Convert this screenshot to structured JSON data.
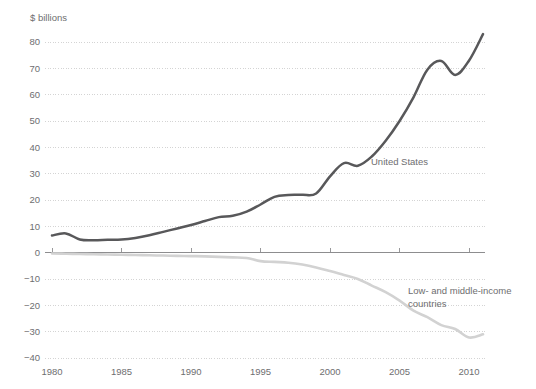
{
  "chart_data": {
    "type": "line",
    "title": "",
    "subtitle": "",
    "unit_label": "$ billions",
    "xlabel": "",
    "ylabel": "$ billions",
    "xlim": [
      1980,
      2011
    ],
    "ylim": [
      -40,
      85
    ],
    "grid": true,
    "legend_position": "inline-annotation",
    "yticks": [
      80,
      70,
      60,
      50,
      40,
      30,
      20,
      10,
      0,
      -10,
      -20,
      -30,
      -40
    ],
    "ytick_labels": [
      "80",
      "70",
      "60",
      "50",
      "40",
      "30",
      "20",
      "10",
      "0",
      "−10",
      "−20",
      "−30",
      "−40"
    ],
    "xticks": [
      1980,
      1985,
      1990,
      1995,
      2000,
      2005,
      2010
    ],
    "xtick_labels": [
      "1980",
      "1985",
      "1990",
      "1995",
      "2000",
      "2005",
      "2010"
    ],
    "x": [
      1980,
      1981,
      1982,
      1983,
      1984,
      1985,
      1986,
      1987,
      1988,
      1989,
      1990,
      1991,
      1992,
      1993,
      1994,
      1995,
      1996,
      1997,
      1998,
      1999,
      2000,
      2001,
      2002,
      2003,
      2004,
      2005,
      2006,
      2007,
      2008,
      2009,
      2010,
      2011
    ],
    "series": [
      {
        "name": "United States",
        "color": "#58585a",
        "label_x": 2004.3,
        "label_y": 38,
        "values": [
          6.5,
          7.3,
          5.0,
          4.7,
          4.9,
          5.0,
          5.6,
          6.6,
          7.9,
          9.2,
          10.5,
          12.0,
          13.5,
          14.0,
          15.6,
          18.3,
          21.2,
          21.9,
          22.0,
          22.5,
          29.0,
          34.0,
          33.0,
          36.5,
          42.5,
          50.0,
          59.0,
          69.5,
          72.8,
          67.5,
          73.0,
          83.0
        ]
      },
      {
        "name": "Low- and middle-income countries",
        "color": "#d2d2d2",
        "label_x": 2006.2,
        "label_y": -14.5,
        "values": [
          -0.3,
          -0.4,
          -0.5,
          -0.6,
          -0.7,
          -0.8,
          -0.9,
          -1.0,
          -1.1,
          -1.2,
          -1.3,
          -1.4,
          -1.6,
          -1.8,
          -2.0,
          -3.2,
          -3.5,
          -3.8,
          -4.5,
          -5.6,
          -7.0,
          -8.5,
          -10.0,
          -12.5,
          -15.0,
          -18.2,
          -22.0,
          -24.5,
          -27.5,
          -29.0,
          -32.2,
          -31.0
        ]
      }
    ],
    "annotations": [
      {
        "text": "United States",
        "series": "United States"
      },
      {
        "text": "Low- and middle-income",
        "series": "Low- and middle-income countries"
      },
      {
        "text": "countries",
        "series": "Low- and middle-income countries"
      }
    ],
    "colors": {
      "gridline": "#cfcfcf",
      "zero_axis": "#8d8d8f",
      "text": "#6e6e70",
      "background": "#ffffff"
    }
  },
  "labels": {
    "unit": "$ billions",
    "us_annotation": "United States",
    "lmic_annotation_line1": "Low- and middle-income",
    "lmic_annotation_line2": "countries"
  }
}
